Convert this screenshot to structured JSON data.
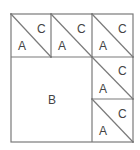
{
  "diagram": {
    "title": "",
    "line_color": "#7a7a7a",
    "label_color": "#444444",
    "outer_square": {
      "x": 11,
      "y": 14,
      "size": 122
    },
    "pieces": [
      {
        "id": "top-1",
        "type": "triangle-pair",
        "labels": {
          "lower": "A",
          "upper": "C"
        }
      },
      {
        "id": "top-2",
        "type": "triangle-pair",
        "labels": {
          "lower": "A",
          "upper": "C"
        }
      },
      {
        "id": "top-3",
        "type": "triangle-pair",
        "labels": {
          "lower": "A",
          "upper": "C"
        }
      },
      {
        "id": "right-2",
        "type": "triangle-pair",
        "labels": {
          "lower": "A",
          "upper": "C"
        }
      },
      {
        "id": "right-3",
        "type": "triangle-pair",
        "labels": {
          "lower": "A",
          "upper": "C"
        }
      },
      {
        "id": "big",
        "type": "square",
        "label": "B"
      }
    ]
  }
}
